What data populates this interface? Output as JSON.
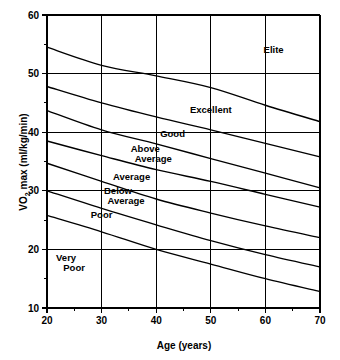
{
  "chart_data": {
    "type": "line",
    "title": "",
    "xlabel": "Age (years)",
    "ylabel": "VO2 max (ml/kg/min)",
    "ylabel_parts": {
      "pre": "VO",
      "sub": "2",
      "post": " max (ml/kg/min)"
    },
    "xlim": [
      20,
      70
    ],
    "ylim": [
      10,
      60
    ],
    "grid": true,
    "legend": "none",
    "x_ticks": [
      20,
      30,
      40,
      50,
      60,
      70
    ],
    "y_ticks": [
      60,
      50,
      40,
      30,
      20,
      10
    ],
    "x_minor_ticks": [
      25,
      35,
      45,
      55,
      65
    ],
    "y_minor_ticks": [
      55,
      45,
      35,
      25,
      15
    ],
    "x_tick_labels": [
      "20",
      "30",
      "40",
      "50",
      "60",
      "70"
    ],
    "y_tick_labels": [
      "60",
      "50",
      "40",
      "30",
      "20",
      "10"
    ],
    "x": [
      20,
      30,
      40,
      50,
      60,
      70
    ],
    "series": [
      {
        "name": "Elite / Excellent boundary",
        "values": [
          54.5,
          51.4,
          49.6,
          47.6,
          44.6,
          41.8
        ]
      },
      {
        "name": "Excellent / Good boundary",
        "values": [
          47.8,
          45.0,
          42.6,
          40.4,
          38.1,
          35.8
        ]
      },
      {
        "name": "Good / Above Average boundary",
        "values": [
          43.7,
          40.4,
          38.0,
          35.5,
          33.0,
          30.5
        ]
      },
      {
        "name": "Above Average / Average boundary",
        "values": [
          38.5,
          36.0,
          33.6,
          31.6,
          29.4,
          27.2
        ]
      },
      {
        "name": "Average / Below Average boundary",
        "values": [
          34.7,
          31.6,
          28.6,
          26.2,
          24.0,
          22.0
        ]
      },
      {
        "name": "Below Average / Poor boundary",
        "values": [
          30.0,
          27.0,
          24.2,
          21.5,
          19.1,
          17.0
        ]
      },
      {
        "name": "Poor / Very Poor boundary",
        "values": [
          25.8,
          23.0,
          20.0,
          17.5,
          15.0,
          12.8
        ]
      }
    ],
    "zones": [
      {
        "id": "elite",
        "label": "Elite",
        "lines": [
          "Elite"
        ],
        "x": 61.5,
        "y": 53.5
      },
      {
        "id": "excellent",
        "label": "Excellent",
        "lines": [
          "Excellent"
        ],
        "x": 50.0,
        "y": 43.2
      },
      {
        "id": "good",
        "label": "Good",
        "lines": [
          "Good"
        ],
        "x": 43.0,
        "y": 39.2
      },
      {
        "id": "above-average",
        "label": "Above Average",
        "lines": [
          "Above",
          "Average"
        ],
        "x": 38.0,
        "y": 36.6
      },
      {
        "id": "average",
        "label": "Average",
        "lines": [
          "Average"
        ],
        "x": 35.5,
        "y": 31.8
      },
      {
        "id": "below-average",
        "label": "Below Average",
        "lines": [
          "Below",
          "Average"
        ],
        "x": 33.0,
        "y": 29.4
      },
      {
        "id": "poor",
        "label": "Poor",
        "lines": [
          "Poor"
        ],
        "x": 30.0,
        "y": 25.3
      },
      {
        "id": "very-poor",
        "label": "Very Poor",
        "lines": [
          "Very",
          "Poor"
        ],
        "x": 23.5,
        "y": 18.0
      }
    ],
    "colors": {
      "line": "#000000",
      "grid": "#000000",
      "background": "#ffffff",
      "text": "#000000"
    }
  }
}
